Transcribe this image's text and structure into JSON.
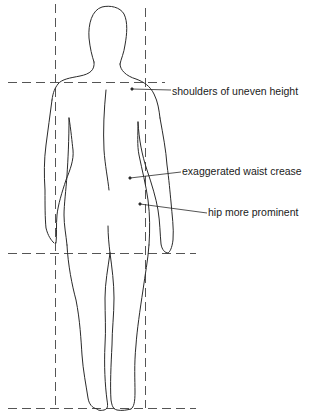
{
  "diagram": {
    "colors": {
      "stroke": "#2a2a2a",
      "guide": "#555555",
      "background": "#ffffff",
      "text": "#1a1a1a"
    },
    "annotations": [
      {
        "id": "shoulders",
        "text": "shoulders of uneven height"
      },
      {
        "id": "waist",
        "text": "exaggerated waist crease"
      },
      {
        "id": "hip",
        "text": "hip more prominent"
      }
    ],
    "guides": {
      "vertical": [
        "left-body-line",
        "right-body-line"
      ],
      "horizontal": [
        "shoulder-line",
        "hip-line",
        "ground-line"
      ]
    }
  }
}
